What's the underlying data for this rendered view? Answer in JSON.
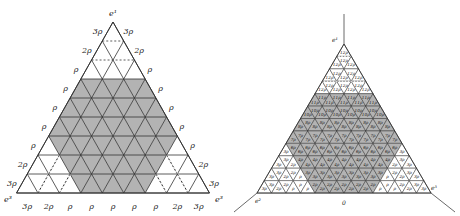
{
  "left": {
    "apex": [
      113,
      22
    ],
    "rows": 9,
    "side": 21.44,
    "row_height": 19.0,
    "fill_gray": "#b3b3b3",
    "line_color": "#333333",
    "vertex_labels": {
      "top": "e¹",
      "bottom_left": "e³",
      "bottom_right": "e³"
    },
    "left_edge_labels": [
      "3ρ",
      "2ρ",
      "ρ",
      "ρ",
      "ρ",
      "ρ",
      "ρ",
      "2ρ",
      "3ρ"
    ],
    "right_edge_labels": [
      "3ρ",
      "2ρ",
      "ρ",
      "ρ",
      "ρ",
      "ρ",
      "ρ",
      "2ρ",
      "3ρ"
    ],
    "bottom_edge_labels": [
      "3ρ",
      "2ρ",
      "ρ",
      "ρ",
      "ρ",
      "ρ",
      "ρ",
      "2ρ",
      "3ρ"
    ]
  },
  "right": {
    "apex": [
      344,
      44
    ],
    "rows": 12,
    "side": 14.5,
    "row_height": 12.42,
    "fill_gray": "#b3b3b3",
    "line_color": "#333333",
    "vertex_labels": {
      "top": "e¹",
      "bottom_left": "e²",
      "bottom_right": "e³"
    },
    "origin_label": "0",
    "row_labels": [
      "12ρ",
      "12ρ",
      "12ρ",
      "12ρ",
      "11ρ",
      "10ρ",
      "8ρ",
      "7ρ",
      "6ρ",
      "4ρ",
      "3ρ",
      "2ρ"
    ]
  }
}
